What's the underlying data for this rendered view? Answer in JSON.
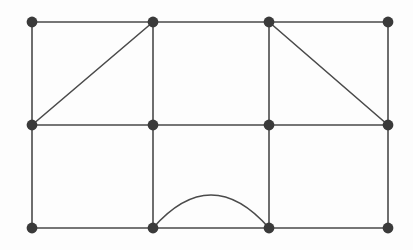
{
  "figure": {
    "width": 413,
    "height": 250,
    "background_color": "#fdfdfd"
  },
  "style": {
    "edge_color": "#4a4a4a",
    "edge_width": 1.6,
    "arc_color": "#4a4a4a",
    "arc_width": 1.6,
    "vertex_color": "#3a3a3a",
    "vertex_radius": 5.4,
    "vertex_count_label": "12",
    "edge_count_label": "20"
  },
  "chart_data": {
    "type": "diagram",
    "vertices": [
      {
        "id": "v1",
        "label": "r1c1",
        "x": 32,
        "y": 22,
        "row": 1,
        "col": 1
      },
      {
        "id": "v2",
        "label": "r1c2",
        "x": 153,
        "y": 22,
        "row": 1,
        "col": 2
      },
      {
        "id": "v3",
        "label": "r1c3",
        "x": 269,
        "y": 22,
        "row": 1,
        "col": 3
      },
      {
        "id": "v4",
        "label": "r1c4",
        "x": 388,
        "y": 22,
        "row": 1,
        "col": 4
      },
      {
        "id": "v5",
        "label": "r2c1",
        "x": 32,
        "y": 125,
        "row": 2,
        "col": 1
      },
      {
        "id": "v6",
        "label": "r2c2",
        "x": 153,
        "y": 125,
        "row": 2,
        "col": 2
      },
      {
        "id": "v7",
        "label": "r2c3",
        "x": 269,
        "y": 125,
        "row": 2,
        "col": 3
      },
      {
        "id": "v8",
        "label": "r2c4",
        "x": 388,
        "y": 125,
        "row": 2,
        "col": 4
      },
      {
        "id": "v9",
        "label": "r3c1",
        "x": 32,
        "y": 228,
        "row": 3,
        "col": 1
      },
      {
        "id": "v10",
        "label": "r3c2",
        "x": 153,
        "y": 228,
        "row": 3,
        "col": 2
      },
      {
        "id": "v11",
        "label": "r3c3",
        "x": 269,
        "y": 228,
        "row": 3,
        "col": 3
      },
      {
        "id": "v12",
        "label": "r3c4",
        "x": 388,
        "y": 228,
        "row": 3,
        "col": 4
      }
    ],
    "edges": [
      {
        "from": "v1",
        "to": "v2",
        "kind": "straight",
        "orientation": "horizontal"
      },
      {
        "from": "v2",
        "to": "v3",
        "kind": "straight",
        "orientation": "horizontal"
      },
      {
        "from": "v3",
        "to": "v4",
        "kind": "straight",
        "orientation": "horizontal"
      },
      {
        "from": "v5",
        "to": "v6",
        "kind": "straight",
        "orientation": "horizontal"
      },
      {
        "from": "v6",
        "to": "v7",
        "kind": "straight",
        "orientation": "horizontal"
      },
      {
        "from": "v7",
        "to": "v8",
        "kind": "straight",
        "orientation": "horizontal"
      },
      {
        "from": "v9",
        "to": "v10",
        "kind": "straight",
        "orientation": "horizontal"
      },
      {
        "from": "v10",
        "to": "v11",
        "kind": "straight",
        "orientation": "horizontal"
      },
      {
        "from": "v11",
        "to": "v12",
        "kind": "straight",
        "orientation": "horizontal"
      },
      {
        "from": "v1",
        "to": "v5",
        "kind": "straight",
        "orientation": "vertical"
      },
      {
        "from": "v2",
        "to": "v6",
        "kind": "straight",
        "orientation": "vertical"
      },
      {
        "from": "v3",
        "to": "v7",
        "kind": "straight",
        "orientation": "vertical"
      },
      {
        "from": "v4",
        "to": "v8",
        "kind": "straight",
        "orientation": "vertical"
      },
      {
        "from": "v5",
        "to": "v9",
        "kind": "straight",
        "orientation": "vertical"
      },
      {
        "from": "v6",
        "to": "v10",
        "kind": "straight",
        "orientation": "vertical"
      },
      {
        "from": "v7",
        "to": "v11",
        "kind": "straight",
        "orientation": "vertical"
      },
      {
        "from": "v8",
        "to": "v12",
        "kind": "straight",
        "orientation": "vertical"
      },
      {
        "from": "v5",
        "to": "v2",
        "kind": "straight",
        "orientation": "diagonal"
      },
      {
        "from": "v3",
        "to": "v8",
        "kind": "straight",
        "orientation": "diagonal"
      },
      {
        "from": "v10",
        "to": "v11",
        "kind": "arc",
        "orientation": "curved",
        "apex_x": 211,
        "apex_y": 195
      }
    ]
  }
}
